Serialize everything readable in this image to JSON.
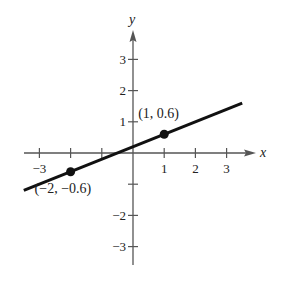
{
  "chart_data": {
    "type": "line",
    "title": "",
    "xlabel": "x",
    "ylabel": "y",
    "xlim": [
      -3.5,
      3.8
    ],
    "ylim": [
      -3.5,
      3.8
    ],
    "grid": false,
    "x_ticks": [
      -3,
      -2,
      -1,
      1,
      2,
      3
    ],
    "x_tick_labels": [
      "−3",
      "",
      "",
      "1",
      "2",
      "3"
    ],
    "y_ticks": [
      -3,
      -2,
      -1,
      1,
      2,
      3
    ],
    "y_tick_labels": [
      "−3",
      "−2",
      "",
      "1",
      "2",
      "3"
    ],
    "series": [
      {
        "name": "line",
        "x": [
          -3.5,
          3.5
        ],
        "y": [
          -1.2,
          1.6
        ],
        "color": "#111111"
      }
    ],
    "points": [
      {
        "x": -2,
        "y": -0.6,
        "label": "(−2, −0.6)"
      },
      {
        "x": 1,
        "y": 0.6,
        "label": "(1, 0.6)"
      }
    ]
  }
}
